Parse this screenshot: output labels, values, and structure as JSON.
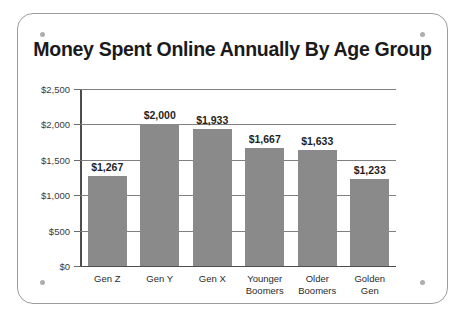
{
  "chart_data": {
    "type": "bar",
    "title": "Money Spent Online Annually By Age Group",
    "xlabel": "",
    "ylabel": "",
    "categories": [
      "Gen Z",
      "Gen Y",
      "Gen X",
      "Younger Boomers",
      "Older Boomers",
      "Golden Gen"
    ],
    "category_lines": [
      [
        "Gen Z"
      ],
      [
        "Gen Y"
      ],
      [
        "Gen X"
      ],
      [
        "Younger",
        "Boomers"
      ],
      [
        "Older",
        "Boomers"
      ],
      [
        "Golden",
        "Gen"
      ]
    ],
    "values": [
      1267,
      2000,
      1933,
      1667,
      1633,
      1233
    ],
    "value_labels": [
      "$1,267",
      "$2,000",
      "$1,933",
      "$1,667",
      "$1,633",
      "$1,233"
    ],
    "ylim": [
      0,
      2500
    ],
    "ytick_values": [
      0,
      500,
      1000,
      1500,
      2000,
      2500
    ],
    "ytick_labels": [
      "$0",
      "$500",
      "$1,000",
      "$1,500",
      "$2,000",
      "$2,500"
    ],
    "grid": true,
    "legend": "none",
    "bar_color": "#8a8a8a",
    "gridline_color": "#808080",
    "axis_color": "#4d4d4d",
    "title_color": "#1a1a1a"
  },
  "panel": {
    "background": "#ffffff",
    "border_color": "#9c9c9c",
    "screw_color": "#aeaeae",
    "screw_names": [
      "screw-top-left",
      "screw-top-right",
      "screw-bottom-left",
      "screw-bottom-right"
    ]
  }
}
